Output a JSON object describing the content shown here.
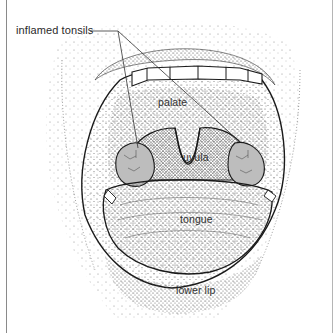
{
  "figure": {
    "labels": {
      "inflamed_tonsils": "inflamed tonsils",
      "palate": "palate",
      "uvula": "uvula",
      "tongue": "tongue",
      "lower_lip": "lower lip"
    },
    "colors": {
      "ink": "#1a1a1a",
      "tonsil_fill": "#b9b9b9",
      "stipple": "#555555",
      "border": "#8a8a8a"
    }
  }
}
